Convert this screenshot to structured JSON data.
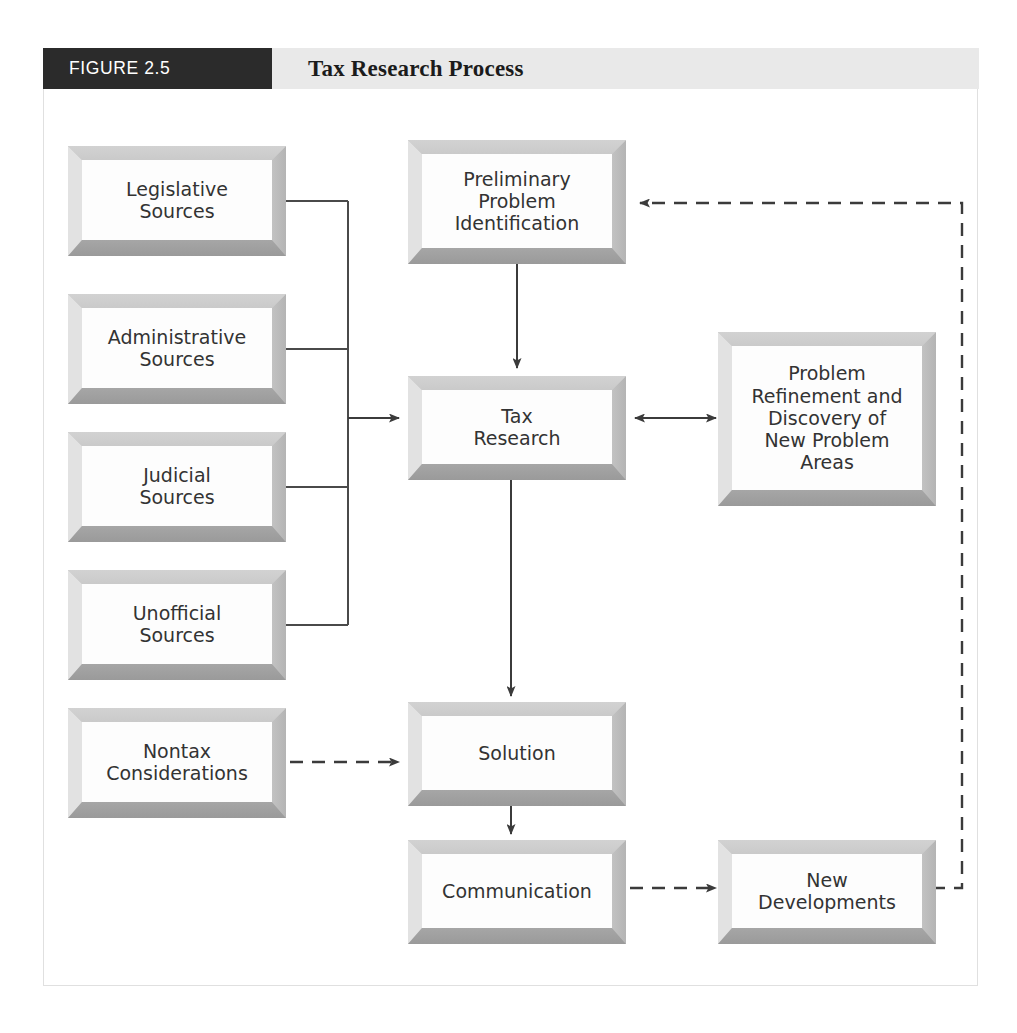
{
  "header": {
    "figure_number": "FIGURE 2.5",
    "title": "Tax Research Process",
    "number_box_color": "#2b2b2b",
    "band_color": "#e9e9e9"
  },
  "diagram": {
    "type": "flowchart",
    "nodes": [
      {
        "id": "legislative",
        "label": "Legislative\nSources",
        "x": 68,
        "y": 146,
        "w": 218,
        "h": 110
      },
      {
        "id": "administrative",
        "label": "Administrative\nSources",
        "x": 68,
        "y": 294,
        "w": 218,
        "h": 110
      },
      {
        "id": "judicial",
        "label": "Judicial\nSources",
        "x": 68,
        "y": 432,
        "w": 218,
        "h": 110
      },
      {
        "id": "unofficial",
        "label": "Unofficial\nSources",
        "x": 68,
        "y": 570,
        "w": 218,
        "h": 110
      },
      {
        "id": "nontax",
        "label": "Nontax\nConsiderations",
        "x": 68,
        "y": 708,
        "w": 218,
        "h": 110
      },
      {
        "id": "preliminary",
        "label": "Preliminary\nProblem\nIdentification",
        "x": 408,
        "y": 140,
        "w": 218,
        "h": 124
      },
      {
        "id": "taxresearch",
        "label": "Tax\nResearch",
        "x": 408,
        "y": 376,
        "w": 218,
        "h": 104
      },
      {
        "id": "refinement",
        "label": "Problem\nRefinement and\nDiscovery of\nNew Problem\nAreas",
        "x": 718,
        "y": 332,
        "w": 218,
        "h": 174
      },
      {
        "id": "solution",
        "label": "Solution",
        "x": 408,
        "y": 702,
        "w": 218,
        "h": 104
      },
      {
        "id": "communication",
        "label": "Communication",
        "x": 408,
        "y": 840,
        "w": 218,
        "h": 104
      },
      {
        "id": "newdev",
        "label": "New\nDevelopments",
        "x": 718,
        "y": 840,
        "w": 218,
        "h": 104
      }
    ],
    "edges": [
      {
        "id": "legislative-to-bus",
        "from": "legislative",
        "to": "bus",
        "style": "solid",
        "arrow": "none"
      },
      {
        "id": "administrative-to-bus",
        "from": "administrative",
        "to": "bus",
        "style": "solid",
        "arrow": "none"
      },
      {
        "id": "judicial-to-bus",
        "from": "judicial",
        "to": "bus",
        "style": "solid",
        "arrow": "none"
      },
      {
        "id": "unofficial-to-bus",
        "from": "unofficial",
        "to": "bus",
        "style": "solid",
        "arrow": "none"
      },
      {
        "id": "bus-to-taxresearch",
        "from": "bus",
        "to": "taxresearch",
        "style": "solid",
        "arrow": "end"
      },
      {
        "id": "preliminary-to-taxresearch",
        "from": "preliminary",
        "to": "taxresearch",
        "style": "solid",
        "arrow": "end"
      },
      {
        "id": "taxresearch-to-refinement",
        "from": "taxresearch",
        "to": "refinement",
        "style": "solid",
        "arrow": "both"
      },
      {
        "id": "taxresearch-to-solution",
        "from": "taxresearch",
        "to": "solution",
        "style": "solid",
        "arrow": "end"
      },
      {
        "id": "nontax-to-solution",
        "from": "nontax",
        "to": "solution",
        "style": "dashed",
        "arrow": "end"
      },
      {
        "id": "solution-to-communication",
        "from": "solution",
        "to": "communication",
        "style": "solid",
        "arrow": "end"
      },
      {
        "id": "communication-to-newdev",
        "from": "communication",
        "to": "newdev",
        "style": "dashed",
        "arrow": "end"
      },
      {
        "id": "newdev-to-preliminary",
        "from": "newdev",
        "to": "preliminary",
        "style": "dashed",
        "arrow": "end"
      }
    ]
  }
}
